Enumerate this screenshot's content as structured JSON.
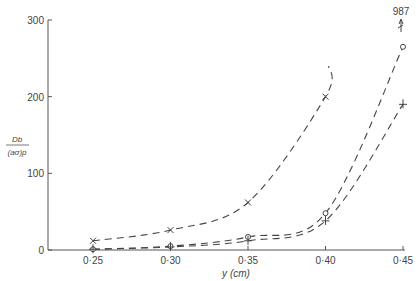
{
  "chart_data": {
    "type": "line",
    "title": "",
    "xlabel": "y (cm)",
    "ylabel_num": "Db",
    "ylabel_den": "(aσ)p",
    "xlim": [
      0.22,
      0.45
    ],
    "ylim": [
      0,
      300
    ],
    "xticks": [
      "0·25",
      "0·30",
      "0·35",
      "0·40",
      "0·45"
    ],
    "xtick_values": [
      0.25,
      0.3,
      0.35,
      0.4,
      0.45
    ],
    "yticks": [
      "0",
      "100",
      "200",
      "300"
    ],
    "ytick_values": [
      0,
      100,
      200,
      300
    ],
    "grid": false,
    "legend": "none",
    "series": [
      {
        "name": "x-markers",
        "marker": "x",
        "x": [
          0.25,
          0.3,
          0.35,
          0.4
        ],
        "values": [
          12,
          26,
          62,
          200
        ],
        "curve_end": [
          0.402,
          240
        ]
      },
      {
        "name": "o-markers",
        "marker": "o",
        "x": [
          0.25,
          0.3,
          0.35,
          0.4,
          0.45
        ],
        "values": [
          1,
          5,
          17,
          48,
          265
        ]
      },
      {
        "name": "+-markers",
        "marker": "+",
        "x": [
          0.25,
          0.3,
          0.35,
          0.4,
          0.45
        ],
        "values": [
          1,
          4,
          12,
          38,
          190
        ]
      }
    ],
    "annotations": [
      {
        "text": "987",
        "x": 0.45,
        "note": "off-scale value with upward arrow"
      }
    ]
  }
}
